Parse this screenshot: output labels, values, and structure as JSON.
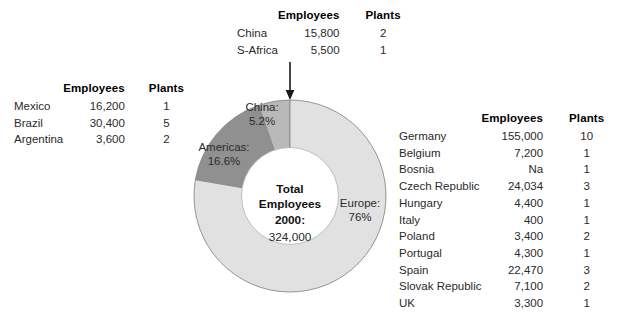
{
  "tables": {
    "top": {
      "name": "asia-africa-table",
      "headers": {
        "region": "",
        "employees": "Employees",
        "plants": "Plants"
      },
      "rows": [
        {
          "region": "China",
          "employees": "15,800",
          "plants": "2"
        },
        {
          "region": "S-Africa",
          "employees": "5,500",
          "plants": "1"
        }
      ]
    },
    "left": {
      "name": "americas-table",
      "headers": {
        "region": "",
        "employees": "Employees",
        "plants": "Plants"
      },
      "rows": [
        {
          "region": "Mexico",
          "employees": "16,200",
          "plants": "1"
        },
        {
          "region": "Brazil",
          "employees": "30,400",
          "plants": "5"
        },
        {
          "region": "Argentina",
          "employees": "3,600",
          "plants": "2"
        }
      ]
    },
    "right": {
      "name": "europe-table",
      "headers": {
        "region": "",
        "employees": "Employees",
        "plants": "Plants"
      },
      "rows": [
        {
          "region": "Germany",
          "employees": "155,000",
          "plants": "10"
        },
        {
          "region": "Belgium",
          "employees": "7,200",
          "plants": "1"
        },
        {
          "region": "Bosnia",
          "employees": "Na",
          "plants": "1"
        },
        {
          "region": "Czech Republic",
          "employees": "24,034",
          "plants": "3"
        },
        {
          "region": "Hungary",
          "employees": "4,400",
          "plants": "1"
        },
        {
          "region": "Italy",
          "employees": "400",
          "plants": "1"
        },
        {
          "region": "Poland",
          "employees": "3,400",
          "plants": "2"
        },
        {
          "region": "Portugal",
          "employees": "4,300",
          "plants": "1"
        },
        {
          "region": "Spain",
          "employees": "22,470",
          "plants": "3"
        },
        {
          "region": "Slovak Republic",
          "employees": "7,100",
          "plants": "2"
        },
        {
          "region": "UK",
          "employees": "3,300",
          "plants": "1"
        }
      ]
    }
  },
  "center": {
    "line1": "Total",
    "line2": "Employees",
    "line3": "2000:",
    "value": "324,000"
  },
  "labels": {
    "china": "China:\n5.2%",
    "china_name": "China:",
    "china_pct": "5.2%",
    "americas_name": "Americas:",
    "americas_pct": "16.6%",
    "europe_name": "Europe:",
    "europe_pct": "76%"
  },
  "chart_data": {
    "type": "pie",
    "variant": "donut",
    "title": "Total Employees 2000: 324,000",
    "categories": [
      "China",
      "Americas",
      "Europe"
    ],
    "values": [
      5.2,
      16.6,
      76.0
    ],
    "value_unit": "%",
    "labels": [
      "China: 5.2%",
      "Americas: 16.6%",
      "Europe: 76%"
    ],
    "colors": [
      "#b9b9b9",
      "#909090",
      "#e1e1e1"
    ],
    "start_angle_deg": 0,
    "direction": "counterclockwise",
    "legend": "none",
    "annotations": [
      "Arrow from China/S-Africa table pointing to the China slice"
    ],
    "total_employees": 324000
  },
  "colors": {
    "slice_china": "#b9b9b9",
    "slice_americas": "#909090",
    "slice_europe": "#e1e1e1",
    "slice_outline": "#8a8a8a",
    "center_fill": "#ffffff",
    "background": "#ffffff",
    "text": "#1a1a1a"
  }
}
